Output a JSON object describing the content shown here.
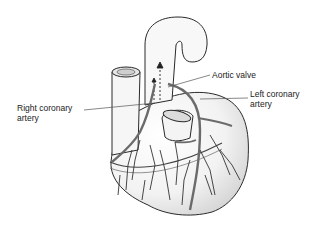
{
  "diagram": {
    "labels": {
      "aortic_valve": "Aortic valve",
      "left_coronary_line1": "Left coronary",
      "left_coronary_line2": "artery",
      "right_coronary_line1": "Right coronary",
      "right_coronary_line2": "artery"
    },
    "colors": {
      "outline": "#2a2a2a",
      "artery": "#6b6b6b",
      "shading": "#d8d8d8",
      "text": "#222222"
    }
  }
}
